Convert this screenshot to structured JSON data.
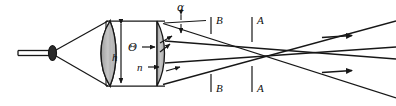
{
  "figure": {
    "kind": "optical-ray-diagram",
    "canvas": {
      "width": 396,
      "height": 106
    },
    "colors": {
      "background": "#ffffff",
      "stroke": "#171717",
      "lens_fill": "#b7b7b7",
      "lens_fill_light": "#cfcfcf",
      "label": "#101010"
    }
  },
  "labels": {
    "alpha": "α",
    "theta": "Θ",
    "height": "h",
    "refractive_index": "n",
    "plane_b_top": "B",
    "plane_b_bottom": "B",
    "plane_a_top": "A",
    "plane_a_bottom": "A"
  },
  "label_positions": {
    "alpha": {
      "x": 183,
      "y": 11
    },
    "theta": {
      "x": 131,
      "y": 50
    },
    "height": {
      "x": 127,
      "y": 60
    },
    "refractive_index": {
      "x": 139,
      "y": 70
    },
    "plane_b_top": {
      "x": 215,
      "y": 20
    },
    "plane_b_bottom": {
      "x": 215,
      "y": 100
    },
    "plane_a_top": {
      "x": 256,
      "y": 20
    },
    "plane_a_bottom": {
      "x": 256,
      "y": 100
    }
  },
  "components": {
    "source": {
      "name": "point-source-emitter",
      "rod_x1": 18,
      "rod_x2": 50,
      "rod_y": 53,
      "emitter_cx": 52,
      "emitter_cy": 53,
      "emitter_rx": 4,
      "emitter_ry": 7
    },
    "lens_1": {
      "name": "plano-convex-lens-left",
      "x": 108,
      "y_top": 21,
      "y_bottom": 86,
      "bulge": 12
    },
    "lens_2": {
      "name": "plano-convex-lens-right",
      "x": 157,
      "y_top": 21,
      "y_bottom": 86,
      "bulge": 9
    },
    "housing": {
      "name": "lens-housing-outline",
      "x_left": 104,
      "x_right": 163,
      "y_top": 21,
      "y_bottom": 86
    },
    "reference_planes": [
      {
        "id": "B",
        "x": 211
      },
      {
        "id": "A",
        "x": 252
      }
    ],
    "direction_arrows": [
      {
        "x1": 322,
        "y1": 37,
        "x2": 352,
        "y2": 35
      },
      {
        "x1": 322,
        "y1": 72,
        "x2": 352,
        "y2": 70
      }
    ]
  },
  "measurements": {
    "height_arrow": {
      "x": 120,
      "y_top": 24,
      "y_bottom": 83
    },
    "alpha_arrow": {
      "x": 181,
      "y_top": 16,
      "y_bottom": 35
    },
    "theta_arrow": {
      "x1": 142,
      "x2": 154,
      "y": 47
    },
    "n_arrow": {
      "x1": 148,
      "x2": 158,
      "y": 67
    }
  },
  "rays": {
    "diverging_from_source": [
      {
        "x1": 56,
        "y1": 51,
        "x2": 108,
        "y2": 21
      },
      {
        "x1": 56,
        "y1": 55,
        "x2": 108,
        "y2": 86
      }
    ],
    "exit_upper_bundle": [
      {
        "x1": 163,
        "y1": 24,
        "x2": 396,
        "y2": 97
      },
      {
        "x1": 163,
        "y1": 40,
        "x2": 396,
        "y2": 58
      }
    ],
    "exit_lower_bundle": [
      {
        "x1": 163,
        "y1": 84,
        "x2": 396,
        "y2": 20
      },
      {
        "x1": 163,
        "y1": 62,
        "x2": 396,
        "y2": 47
      }
    ]
  }
}
